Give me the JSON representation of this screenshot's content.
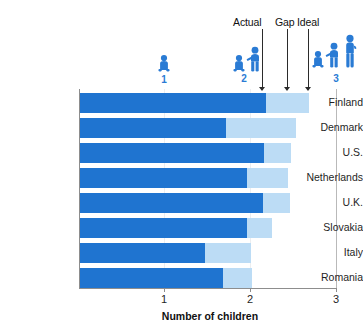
{
  "chart_data": {
    "type": "bar",
    "subtype": "stacked-horizontal",
    "title": "",
    "xlabel": "Number of children",
    "ylabel": "",
    "xlim": [
      0,
      3
    ],
    "xticks": [
      1,
      2,
      3
    ],
    "xtick_labels": [
      "1",
      "2",
      "3"
    ],
    "grid": false,
    "legend_position": "top",
    "categories": [
      "Finland",
      "Denmark",
      "U.S.",
      "Netherlands",
      "U.K.",
      "Slovakia",
      "Italy",
      "Romania"
    ],
    "series": [
      {
        "name": "Actual",
        "color": "#1f74d0",
        "values": [
          2.18,
          1.71,
          2.16,
          1.96,
          2.15,
          1.96,
          1.47,
          1.68
        ]
      },
      {
        "name": "Gap",
        "color": "#bcdcf5",
        "values": [
          0.5,
          0.82,
          0.31,
          0.48,
          0.31,
          0.29,
          0.53,
          0.33
        ]
      }
    ],
    "ideal_totals": [
      2.68,
      2.53,
      2.47,
      2.44,
      2.46,
      2.25,
      2.0,
      2.01
    ],
    "annotations": [
      {
        "label": "Actual",
        "x": 2.15
      },
      {
        "label": "Gap",
        "x": 2.44
      },
      {
        "label": "Ideal",
        "x": 2.68
      }
    ],
    "pictograms": [
      {
        "number": "1",
        "x": 1.0,
        "figures": 1
      },
      {
        "number": "2",
        "x": 2.0,
        "figures": 2
      },
      {
        "number": "3",
        "x": 2.9,
        "figures": 3
      }
    ]
  },
  "colors": {
    "actual": "#1f74d0",
    "gap": "#bcdcf5",
    "pictogram": "#2a7bd4",
    "axis": "#8d8d8d",
    "annotation": "#2b2b2b",
    "background": "#ffffff"
  },
  "axis": {
    "x_title": "Number of children",
    "tick_1": "1",
    "tick_2": "2",
    "tick_3": "3"
  },
  "callouts": {
    "actual": "Actual",
    "gap": "Gap",
    "ideal": "Ideal"
  },
  "pictogram_numbers": {
    "one": "1",
    "two": "2",
    "three": "3"
  },
  "categories": {
    "c0": "Finland",
    "c1": "Denmark",
    "c2": "U.S.",
    "c3": "Netherlands",
    "c4": "U.K.",
    "c5": "Slovakia",
    "c6": "Italy",
    "c7": "Romania"
  }
}
